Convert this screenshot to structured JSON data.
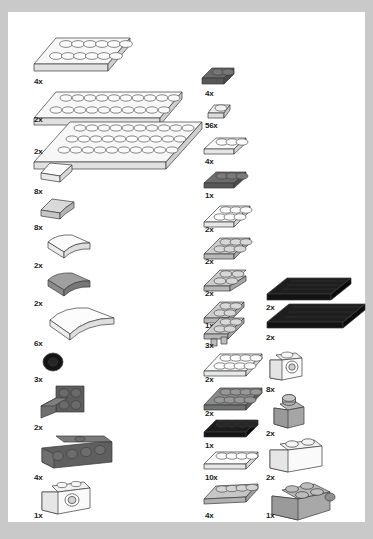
{
  "document": {
    "kind": "lego-building-instructions-parts-inventory",
    "page_background": "#c9c9c9",
    "sheet_background": "#ffffff"
  },
  "palette": {
    "white": "#f4f4f4",
    "light_gray": "#d6d6d6",
    "medium_gray": "#a8a8a8",
    "dark_gray": "#565656",
    "black": "#141414",
    "outline": "#3a3a3a",
    "label_color": "#1a1a1a"
  },
  "columns": [
    {
      "name": "left-column",
      "parts": [
        {
          "id": "L1",
          "qty": "4x",
          "name": "plate-2x6",
          "color": "white",
          "shape": "plate",
          "studs_w": 6,
          "studs_d": 2
        },
        {
          "id": "L2",
          "qty": "2x",
          "name": "plate-2x10",
          "color": "white",
          "shape": "plate",
          "studs_w": 10,
          "studs_d": 2
        },
        {
          "id": "L3",
          "qty": "2x",
          "name": "plate-4x12",
          "color": "white",
          "shape": "plate",
          "studs_w": 12,
          "studs_d": 4
        },
        {
          "id": "L4",
          "qty": "8x",
          "name": "slope-curved-white-small",
          "color": "white",
          "shape": "wedge"
        },
        {
          "id": "L5",
          "qty": "8x",
          "name": "slope-light-gray-small",
          "color": "light_gray",
          "shape": "slope"
        },
        {
          "id": "L6",
          "qty": "2x",
          "name": "slope-curved-white-2x2",
          "color": "white",
          "shape": "curved"
        },
        {
          "id": "L7",
          "qty": "2x",
          "name": "slope-curved-dark-gray-2x2",
          "color": "medium_gray",
          "shape": "curved"
        },
        {
          "id": "L8",
          "qty": "6x",
          "name": "slope-curved-white-wide-4x2",
          "color": "white",
          "shape": "curved-wide"
        },
        {
          "id": "L9",
          "qty": "3x",
          "name": "tire-small-black",
          "color": "black",
          "shape": "tire"
        },
        {
          "id": "L10",
          "qty": "2x",
          "name": "bracket-2x2-dark-gray",
          "color": "dark_gray",
          "shape": "bracket"
        },
        {
          "id": "L11",
          "qty": "4x",
          "name": "bracket-1x4-dark-gray",
          "color": "dark_gray",
          "shape": "bracket-long"
        },
        {
          "id": "L12",
          "qty": "1x",
          "name": "brick-1x2-with-hole-white",
          "color": "white",
          "shape": "brick-hole"
        }
      ]
    },
    {
      "name": "right-column-inner",
      "parts": [
        {
          "id": "R1",
          "qty": "4x",
          "name": "plate-1x2-dark-gray",
          "color": "dark_gray",
          "shape": "plate",
          "studs_w": 2,
          "studs_d": 1
        },
        {
          "id": "R2",
          "qty": "56x",
          "name": "plate-1x1-white",
          "color": "white",
          "shape": "plate",
          "studs_w": 1,
          "studs_d": 1
        },
        {
          "id": "R3",
          "qty": "4x",
          "name": "plate-1x3-white",
          "color": "white",
          "shape": "plate",
          "studs_w": 3,
          "studs_d": 1
        },
        {
          "id": "R4",
          "qty": "1x",
          "name": "plate-1x3-dark-gray",
          "color": "dark_gray",
          "shape": "plate",
          "studs_w": 3,
          "studs_d": 1
        },
        {
          "id": "R5",
          "qty": "2x",
          "name": "plate-2x3-white",
          "color": "white",
          "shape": "plate",
          "studs_w": 3,
          "studs_d": 2
        },
        {
          "id": "R6",
          "qty": "2x",
          "name": "plate-2x3-light-gray",
          "color": "light_gray",
          "shape": "plate",
          "studs_w": 3,
          "studs_d": 2
        },
        {
          "id": "R7",
          "qty": "2x",
          "name": "plate-2x2-corner-light-gray",
          "color": "light_gray",
          "shape": "plate",
          "studs_w": 2,
          "studs_d": 2
        },
        {
          "id": "R8",
          "qty": "1x",
          "name": "plate-2x2-light-gray",
          "color": "light_gray",
          "shape": "plate",
          "studs_w": 2,
          "studs_d": 2
        },
        {
          "id": "R9",
          "qty": "3x",
          "name": "plate-2x2-with-pin-light-gray",
          "color": "light_gray",
          "shape": "plate-pin"
        },
        {
          "id": "R10",
          "qty": "2x",
          "name": "plate-2x4-white",
          "color": "white",
          "shape": "plate",
          "studs_w": 4,
          "studs_d": 2
        },
        {
          "id": "R11",
          "qty": "2x",
          "name": "plate-2x4-dark-gray",
          "color": "dark_gray",
          "shape": "plate",
          "studs_w": 4,
          "studs_d": 2
        },
        {
          "id": "R12",
          "qty": "1x",
          "name": "plate-1x4-black",
          "color": "black",
          "shape": "plate",
          "studs_w": 4,
          "studs_d": 1
        },
        {
          "id": "R13",
          "qty": "10x",
          "name": "plate-1x4-white",
          "color": "white",
          "shape": "plate",
          "studs_w": 4,
          "studs_d": 1
        },
        {
          "id": "R14",
          "qty": "4x",
          "name": "plate-1x4-light-gray",
          "color": "light_gray",
          "shape": "plate",
          "studs_w": 4,
          "studs_d": 1
        }
      ]
    },
    {
      "name": "right-column-outer",
      "parts": [
        {
          "id": "O1",
          "qty": "2x",
          "name": "tile-1x8-black",
          "color": "black",
          "shape": "tile-long"
        },
        {
          "id": "O2",
          "qty": "2x",
          "name": "tile-1x10-black",
          "color": "black",
          "shape": "tile-long"
        },
        {
          "id": "O3",
          "qty": "8x",
          "name": "brick-1x1-headlight-white",
          "color": "white",
          "shape": "headlight"
        },
        {
          "id": "O4",
          "qty": "2x",
          "name": "brick-1x1-medium-gray",
          "color": "medium_gray",
          "shape": "brick1x1"
        },
        {
          "id": "O5",
          "qty": "2x",
          "name": "brick-1x2-white",
          "color": "white",
          "shape": "brick1x2"
        },
        {
          "id": "O6",
          "qty": "1x",
          "name": "brick-2x2-with-pins-medium-gray",
          "color": "medium_gray",
          "shape": "brick2x2"
        }
      ]
    }
  ]
}
